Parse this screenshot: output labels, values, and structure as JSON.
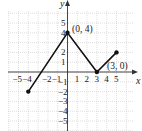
{
  "chart_data": {
    "type": "line",
    "title": "",
    "xlabel": "x",
    "ylabel": "y",
    "xlim": [
      -6,
      6.5
    ],
    "ylim": [
      -6,
      6
    ],
    "grid": true,
    "x_ticks": [
      "−5",
      "−4",
      "−2",
      "−1",
      "1",
      "2",
      "3",
      "4",
      "5"
    ],
    "y_ticks": [
      "5",
      "4",
      "2",
      "1",
      "−1",
      "−2",
      "−3",
      "−4",
      "−5"
    ],
    "series": [
      {
        "name": "f",
        "x": [
          -4,
          0,
          3,
          5
        ],
        "y": [
          -2,
          4,
          0,
          2
        ]
      }
    ],
    "endpoints": [
      {
        "x": -4,
        "y": -2
      },
      {
        "x": 0,
        "y": 4
      },
      {
        "x": 3,
        "y": 0
      },
      {
        "x": 5,
        "y": 2
      }
    ],
    "annotations": [
      {
        "text": "(0, 4)",
        "x": 0,
        "y": 4
      },
      {
        "text": "(3, 0)",
        "x": 3,
        "y": 0
      }
    ],
    "colors": {
      "line": "#111111",
      "grid": "#c8c8c8",
      "axis": "#333333"
    }
  }
}
